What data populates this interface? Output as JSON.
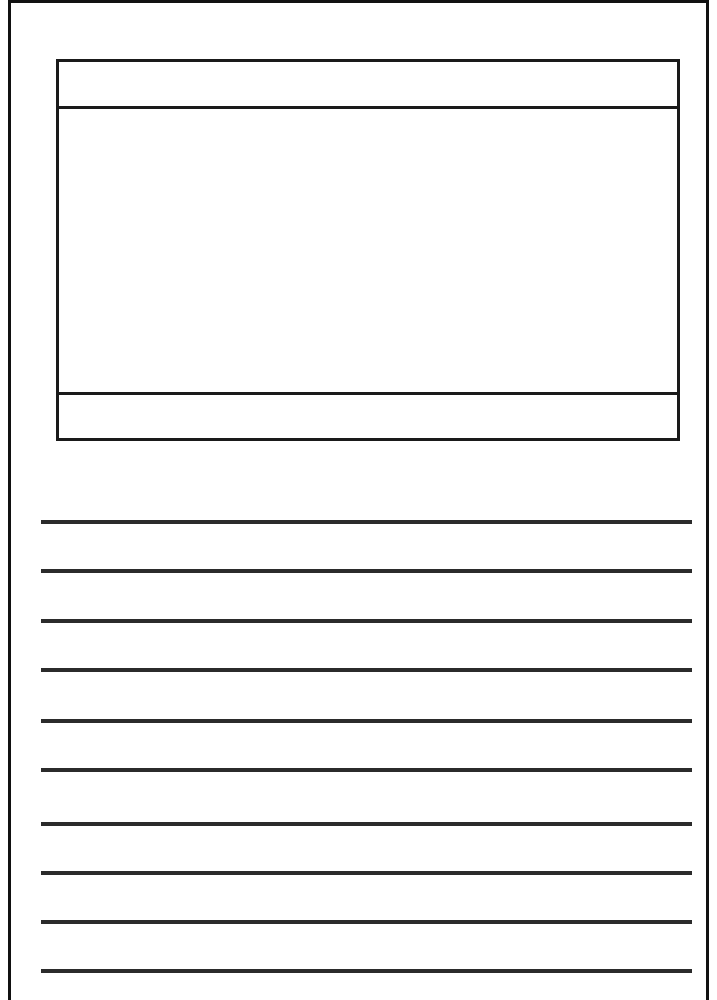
{
  "page": {
    "type": "writing-paper-template",
    "picture_box": {
      "title_text": "",
      "drawing_text": "",
      "caption_text": ""
    },
    "writing_lines": [
      {
        "top": 520,
        "text": ""
      },
      {
        "top": 569,
        "text": ""
      },
      {
        "top": 619,
        "text": ""
      },
      {
        "top": 668,
        "text": ""
      },
      {
        "top": 719,
        "text": ""
      },
      {
        "top": 768,
        "text": ""
      },
      {
        "top": 822,
        "text": ""
      },
      {
        "top": 871,
        "text": ""
      },
      {
        "top": 920,
        "text": ""
      },
      {
        "top": 969,
        "text": ""
      }
    ],
    "colors": {
      "border": "#111111",
      "line": "#2b2b2b",
      "background": "#ffffff"
    }
  }
}
